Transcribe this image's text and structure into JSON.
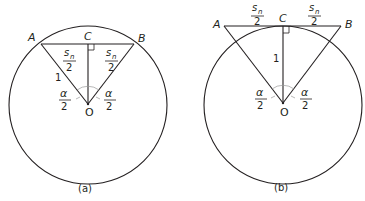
{
  "diagrams": [
    {
      "id": "a",
      "caption": "(a)",
      "points": {
        "A": "A",
        "B": "B",
        "C": "C",
        "O": "O"
      },
      "radius_label": "1",
      "half_chord_num": "s",
      "half_chord_sub": "n",
      "half_chord_den": "2",
      "angle_num": "α",
      "angle_den": "2"
    },
    {
      "id": "b",
      "caption": "(b)",
      "points": {
        "A": "A",
        "B": "B",
        "C": "C",
        "O": "O"
      },
      "radius_label": "1",
      "half_chord_num": "s",
      "half_chord_sub": "n",
      "half_chord_den": "2",
      "angle_num": "α",
      "angle_den": "2"
    }
  ],
  "colors": {
    "stroke": "#231f20",
    "angle_arc": "#9a9a9a",
    "background": "#ffffff"
  }
}
